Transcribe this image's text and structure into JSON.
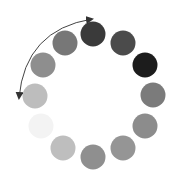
{
  "diagram": {
    "type": "loading-spinner",
    "width": 175,
    "height": 181,
    "background": "#ffffff",
    "dot_radius": 12.5,
    "dots": [
      {
        "cx": 93,
        "cy": 34,
        "color": "#3a3a3a"
      },
      {
        "cx": 123,
        "cy": 43,
        "color": "#4b4b4b"
      },
      {
        "cx": 145,
        "cy": 65,
        "color": "#1c1c1c"
      },
      {
        "cx": 153,
        "cy": 95,
        "color": "#7b7b7b"
      },
      {
        "cx": 145,
        "cy": 126,
        "color": "#8c8c8c"
      },
      {
        "cx": 123,
        "cy": 148,
        "color": "#959595"
      },
      {
        "cx": 93,
        "cy": 157,
        "color": "#8f8f8f"
      },
      {
        "cx": 63,
        "cy": 148,
        "color": "#bebebe"
      },
      {
        "cx": 41,
        "cy": 126,
        "color": "#f3f3f3"
      },
      {
        "cx": 35,
        "cy": 96,
        "color": "#bdbdbd"
      },
      {
        "cx": 43,
        "cy": 65,
        "color": "#8e8e8e"
      },
      {
        "cx": 65,
        "cy": 43,
        "color": "#777777"
      }
    ],
    "arrow": {
      "shape": "double-headed-arc",
      "color": "#444444",
      "start": {
        "x": 19,
        "y": 98
      },
      "end": {
        "x": 92,
        "y": 19
      },
      "control": {
        "x": 25,
        "y": 30
      }
    }
  }
}
